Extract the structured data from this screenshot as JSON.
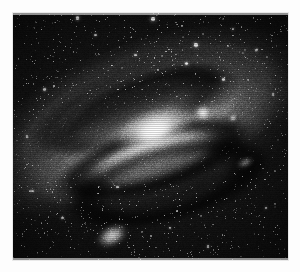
{
  "page": {
    "background_color": "#fdfdfd",
    "width": 300,
    "height": 272
  },
  "plate": {
    "name": "Andromeda Galaxy photographic plate",
    "caption": "",
    "frame": {
      "x": 13,
      "y": 13,
      "width": 275,
      "height": 247
    },
    "background_color": "#050505",
    "medium": "black-and-white astronomical photograph",
    "subject": "Great Spiral Nebula in Andromeda (M31)",
    "grain": "heavy photographic emulsion grain",
    "star_count": 1400
  },
  "galaxy": {
    "name": "M31 Andromeda Galaxy",
    "center_x_pct": 48,
    "center_y_pct": 52,
    "inclination_deg": -20,
    "nucleus_color": "#ffffff",
    "disk_color": "#b0b0b0",
    "dust_lane_color": "#2e2e2e",
    "halo_color": "#606060"
  },
  "objects": [
    {
      "id": "m32",
      "label": "M32",
      "type": "companion-elliptical-galaxy",
      "x_pct": 69.0,
      "y_pct": 40.5,
      "w_pct": 6.5,
      "h_pct": 7.0,
      "rotation_deg": 0,
      "blur_px": 1.6,
      "brightness": 1.0,
      "color": "#ffffff"
    },
    {
      "id": "star-a",
      "label": "foreground star",
      "type": "star",
      "x_pct": 80.0,
      "y_pct": 42.5,
      "w_pct": 3.0,
      "h_pct": 3.2,
      "rotation_deg": 0,
      "blur_px": 0.9,
      "brightness": 0.9,
      "color": "#ffffff"
    },
    {
      "id": "m110",
      "label": "M110 (NGC 205)",
      "type": "companion-elliptical-galaxy",
      "x_pct": 36.0,
      "y_pct": 90.5,
      "w_pct": 13.0,
      "h_pct": 9.0,
      "rotation_deg": -28,
      "blur_px": 2.2,
      "brightness": 1.0,
      "color": "#ffffff"
    },
    {
      "id": "knot-se",
      "label": "bright knot",
      "type": "nebulous-knot",
      "x_pct": 84.5,
      "y_pct": 60.5,
      "w_pct": 7.0,
      "h_pct": 3.0,
      "rotation_deg": -22,
      "blur_px": 2.0,
      "brightness": 0.75,
      "color": "#e8e8e8"
    }
  ],
  "bright_stars": [
    {
      "x_pct": 23.5,
      "y_pct": 2.0,
      "r_px": 1.6,
      "a": 0.95
    },
    {
      "x_pct": 51.0,
      "y_pct": 2.5,
      "r_px": 1.8,
      "a": 1.0
    },
    {
      "x_pct": 66.5,
      "y_pct": 13.0,
      "r_px": 1.7,
      "a": 0.95
    },
    {
      "x_pct": 63.0,
      "y_pct": 20.5,
      "r_px": 1.5,
      "a": 0.9
    },
    {
      "x_pct": 80.0,
      "y_pct": 6.5,
      "r_px": 1.4,
      "a": 0.85
    },
    {
      "x_pct": 88.5,
      "y_pct": 15.0,
      "r_px": 1.3,
      "a": 0.8
    },
    {
      "x_pct": 76.5,
      "y_pct": 27.0,
      "r_px": 1.3,
      "a": 0.8
    },
    {
      "x_pct": 11.5,
      "y_pct": 31.0,
      "r_px": 1.2,
      "a": 0.75
    },
    {
      "x_pct": 30.0,
      "y_pct": 9.0,
      "r_px": 1.2,
      "a": 0.75
    },
    {
      "x_pct": 44.5,
      "y_pct": 17.0,
      "r_px": 1.2,
      "a": 0.72
    },
    {
      "x_pct": 7.0,
      "y_pct": 72.0,
      "r_px": 1.3,
      "a": 0.78
    },
    {
      "x_pct": 18.0,
      "y_pct": 83.0,
      "r_px": 1.2,
      "a": 0.74
    },
    {
      "x_pct": 57.0,
      "y_pct": 87.0,
      "r_px": 1.2,
      "a": 0.74
    },
    {
      "x_pct": 92.0,
      "y_pct": 79.0,
      "r_px": 1.3,
      "a": 0.78
    },
    {
      "x_pct": 71.0,
      "y_pct": 94.5,
      "r_px": 1.2,
      "a": 0.72
    },
    {
      "x_pct": 38.0,
      "y_pct": 70.5,
      "r_px": 1.2,
      "a": 0.7
    },
    {
      "x_pct": 94.5,
      "y_pct": 33.0,
      "r_px": 1.2,
      "a": 0.72
    },
    {
      "x_pct": 5.0,
      "y_pct": 50.0,
      "r_px": 1.2,
      "a": 0.7
    }
  ]
}
